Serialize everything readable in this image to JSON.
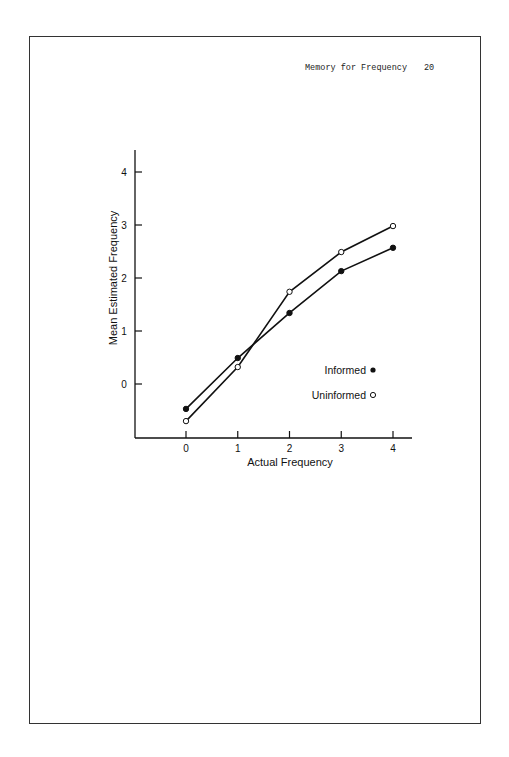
{
  "header": {
    "running_title": "Memory for Frequency",
    "page_number": "20"
  },
  "colors": {
    "line": "#111111",
    "border": "#333333",
    "background": "#ffffff"
  },
  "chart_data": {
    "type": "line",
    "title": "",
    "xlabel": "Actual Frequency",
    "ylabel": "Mean Estimated Frequency",
    "x": [
      0,
      1,
      2,
      3,
      4
    ],
    "x_ticks": [
      "0",
      "1",
      "2",
      "3",
      "4"
    ],
    "y_ticks": [
      "0",
      "1",
      "2",
      "3",
      "4"
    ],
    "xlim": [
      -1,
      4.4
    ],
    "ylim": [
      -1,
      4.4
    ],
    "grid": false,
    "legend_position": "lower right (inside plot)",
    "series": [
      {
        "name": "Informed",
        "marker": "filled-circle",
        "values": [
          -0.47,
          0.49,
          1.34,
          2.13,
          2.57
        ]
      },
      {
        "name": "Uninformed",
        "marker": "open-circle",
        "values": [
          -0.7,
          0.32,
          1.74,
          2.49,
          2.98
        ]
      }
    ],
    "legend": [
      {
        "label": "Informed",
        "marker": "filled-circle"
      },
      {
        "label": "Uninformed",
        "marker": "open-circle"
      }
    ]
  }
}
